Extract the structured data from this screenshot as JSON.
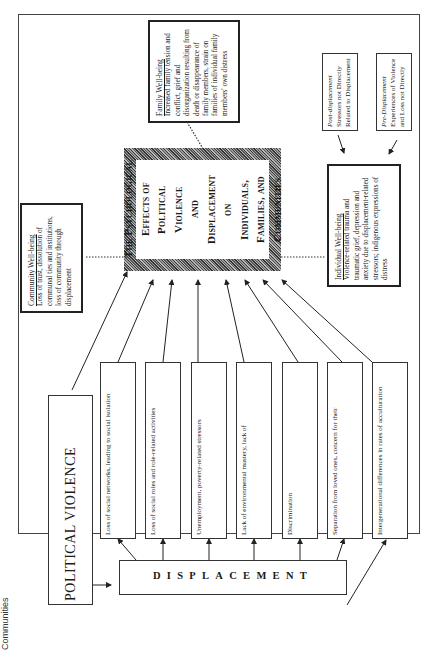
{
  "diagram": {
    "type": "conceptual-model",
    "orientation": "rotated-90-ccw",
    "side_label": "Communities",
    "center": {
      "title_lines": [
        "The Psychological",
        "Effects of Political",
        "Violence",
        "and",
        "Displacement",
        "on",
        "Individuals,",
        "Families, and",
        "Communities"
      ]
    },
    "source": {
      "political_violence": "POLITICAL VIOLENCE",
      "displacement": "DISPLACEMENT"
    },
    "displacement_factors": [
      "Loss of social networks, leading to social isolation",
      "Loss of social roles and role-related activities",
      "Unemployment, poverty-related stressors",
      "Lack of environmental mastery, lack of",
      "Discrimination",
      "Separation from loved ones, concern for their",
      "Intergenerational differences in rates of acculturation"
    ],
    "outcomes": {
      "family": {
        "heading": "Family Well-being",
        "body": "Increased family tension and conflict, grief and disorganization resulting from death or disappearance of family members, strain on families of individual family members' own distress"
      },
      "community": {
        "heading": "Community Well-being",
        "body": "Loss of trust, dissolution of communal ties and institutions, loss of community through displacement"
      },
      "individual": {
        "heading": "Individual Well-being",
        "body": "Violence-related trauma and traumatic grief, depression and anxiety due to displacement-related stressors; indigenous expressions of distress"
      }
    },
    "other_stressors": {
      "post": {
        "prefix": "Post-displacement",
        "rest": " Stressors not Directly Related to Displacement"
      },
      "pre": {
        "prefix": "Pre-Displacement",
        "rest": " Experiences of Violence and Loss not Directly"
      }
    }
  }
}
